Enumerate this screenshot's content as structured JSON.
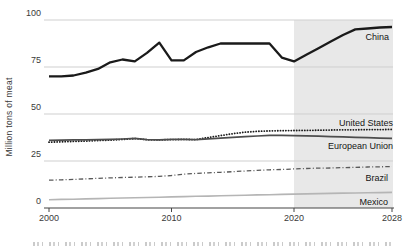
{
  "chart_data": {
    "type": "line",
    "title": "",
    "xlabel": "",
    "ylabel": "Million tons of meat",
    "xlim": [
      2000,
      2028
    ],
    "ylim": [
      0,
      100
    ],
    "x": {
      "start": 2000,
      "end": 2028,
      "step": 1
    },
    "x_ticks": [
      2000,
      2010,
      2020,
      2028
    ],
    "y_ticks": [
      0,
      25,
      50,
      75,
      100
    ],
    "grid": true,
    "legend_position": "inline-right",
    "forecast_start": 2020,
    "forecast_fill": "#e8e8e8",
    "series": [
      {
        "name": "China",
        "style": "solid",
        "color": "#1a1a1a",
        "width": 2.3,
        "values": [
          70,
          70,
          70.5,
          72,
          74,
          77.5,
          79,
          78,
          82.5,
          88,
          78.5,
          78.5,
          83,
          85.5,
          87.5,
          87.5,
          87.5,
          87.5,
          87.5,
          80,
          78,
          81.5,
          85,
          88.5,
          92,
          95,
          95.5,
          96,
          96.3
        ]
      },
      {
        "name": "United States",
        "style": "dotted",
        "color": "#1a1a1a",
        "width": 1.8,
        "values": [
          35,
          35.2,
          35.4,
          35.6,
          35.9,
          36.1,
          36.5,
          36.9,
          36.3,
          36.2,
          36.4,
          36.5,
          36.4,
          37.5,
          38.5,
          39.5,
          40.3,
          40.8,
          41,
          41.1,
          41.2,
          41.3,
          41.4,
          41.5,
          41.6,
          41.6,
          41.7,
          41.7,
          41.8
        ]
      },
      {
        "name": "European Union",
        "style": "solid",
        "color": "#4d4d4d",
        "width": 1.7,
        "values": [
          36,
          36.1,
          36.2,
          36.3,
          36.4,
          36.5,
          36.7,
          37,
          36.4,
          36.3,
          36.5,
          36.5,
          36.4,
          36.8,
          37.2,
          37.6,
          37.9,
          38.3,
          38.6,
          38.6,
          38.5,
          38.4,
          38.2,
          38,
          37.8,
          37.6,
          37.4,
          37.2,
          37
        ]
      },
      {
        "name": "Brazil",
        "style": "dashdot",
        "color": "#595959",
        "width": 1.3,
        "values": [
          14.8,
          15,
          15.2,
          15.5,
          15.8,
          16,
          16.2,
          16.4,
          16.6,
          16.8,
          17.3,
          18,
          18.4,
          18.7,
          19,
          19.3,
          19.7,
          20,
          20.3,
          20.5,
          20.8,
          21,
          21.2,
          21.3,
          21.5,
          21.6,
          21.8,
          21.9,
          22
        ]
      },
      {
        "name": "Mexico",
        "style": "solid",
        "color": "#b5b5b5",
        "width": 1.6,
        "values": [
          4.4,
          4.55,
          4.7,
          4.85,
          5,
          5.15,
          5.3,
          5.45,
          5.6,
          5.75,
          5.9,
          6.05,
          6.2,
          6.35,
          6.5,
          6.65,
          6.8,
          6.95,
          7.1,
          7.25,
          7.4,
          7.5,
          7.65,
          7.75,
          7.9,
          8,
          8.1,
          8.2,
          8.3
        ]
      }
    ],
    "axis_color": "#444444",
    "gridline_color": "#cfcfcf"
  }
}
